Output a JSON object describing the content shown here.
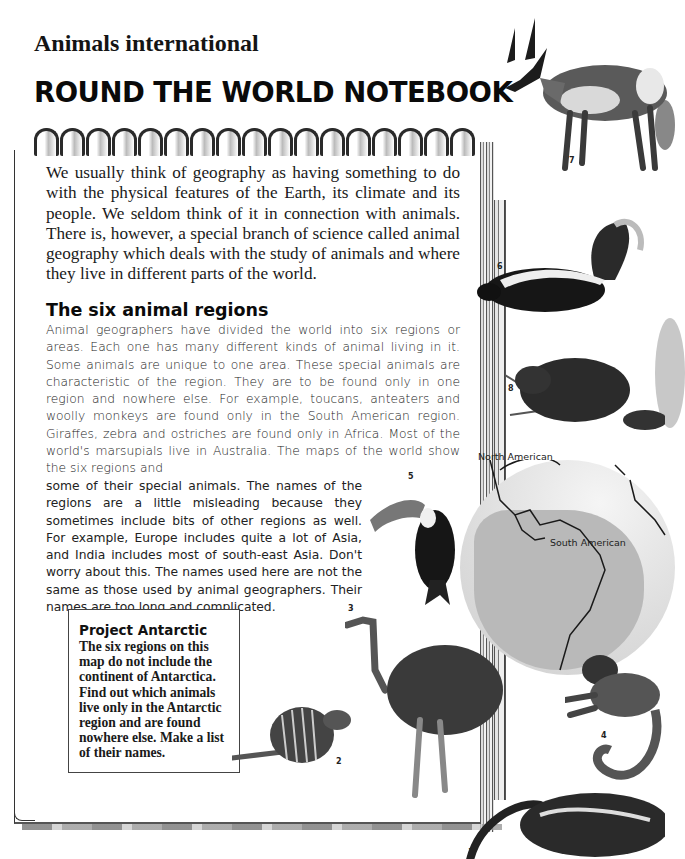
{
  "header": {
    "kicker": "Animals international",
    "title": "ROUND THE WORLD NOTEBOOK"
  },
  "intro": "We usually think of geography as having something to do with the physical features of the Earth, its climate and its people. We seldom think of it in connection with animals. There is, however, a special branch of science called animal geography which deals with the study of animals and where they live in different parts of the world.",
  "section": {
    "heading": "The six animal regions",
    "body_top": "Animal geographers have divided the world into six regions or areas. Each one has many different kinds of animal living in it. Some animals are unique to one area. These special animals are characteristic of the region. They are to be found only in one region and nowhere else. For example, toucans, anteaters and woolly monkeys are found only in the South American region. Giraffes, zebra and ostriches are found only in Africa. Most of the world's marsupials live in Australia. The maps of the world show the six regions and",
    "body_bottom": "some of their special animals. The names of the regions are a little misleading because they sometimes include bits of other regions as well. For example, Europe includes quite a lot of Asia, and India includes most of south-east Asia. Don't worry about this. The names used here are not the same as those used by animal geographers. Their names are too long and complicated."
  },
  "project": {
    "title": "Project Antarctic",
    "text": "The six regions on this map do not include the continent of Antarctica. Find out which animals live only in the Antarctic region and are found nowhere else. Make a list of their names."
  },
  "map": {
    "labels": [
      "North American",
      "South American"
    ]
  },
  "illustrations": {
    "numbers": [
      "1",
      "2",
      "3",
      "4",
      "5",
      "6",
      "7",
      "8"
    ],
    "animals": [
      "anteater",
      "armadillo",
      "rhea",
      "woolly monkey",
      "toucan",
      "skunk",
      "pronghorn",
      "beaver"
    ]
  },
  "colors": {
    "text": "#1a1a1a",
    "globe_region": "#b9b9b9",
    "background": "#ffffff"
  }
}
